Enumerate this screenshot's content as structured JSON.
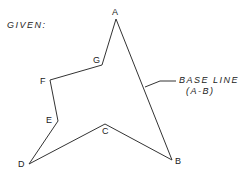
{
  "title": "GIVEN:",
  "annotation": {
    "line1": "BASE LINE",
    "line2": "(A-B)"
  },
  "colors": {
    "stroke": "#333333",
    "text": "#222222",
    "background": "#ffffff"
  },
  "vertices": [
    {
      "id": "A",
      "label": "A",
      "x": 116,
      "y": 19
    },
    {
      "id": "B",
      "label": "B",
      "x": 172,
      "y": 160
    },
    {
      "id": "C",
      "label": "C",
      "x": 105,
      "y": 124
    },
    {
      "id": "D",
      "label": "D",
      "x": 29,
      "y": 164
    },
    {
      "id": "E",
      "label": "E",
      "x": 58,
      "y": 121
    },
    {
      "id": "F",
      "label": "F",
      "x": 50,
      "y": 80
    },
    {
      "id": "G",
      "label": "G",
      "x": 102,
      "y": 65
    }
  ],
  "polygon_order": [
    "A",
    "B",
    "C",
    "D",
    "E",
    "F",
    "G"
  ]
}
